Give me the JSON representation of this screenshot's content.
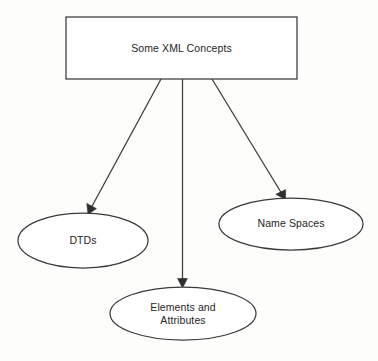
{
  "diagram": {
    "title_node": {
      "label": "Some XML Concepts",
      "shape": "rectangle"
    },
    "children": [
      {
        "id": "dtds",
        "label": "DTDs",
        "shape": "ellipse"
      },
      {
        "id": "elements-and-attributes",
        "label_line1": "Elements and",
        "label_line2": "Attributes",
        "shape": "ellipse"
      },
      {
        "id": "name-spaces",
        "label": "Name Spaces",
        "shape": "ellipse"
      }
    ],
    "colors": {
      "stroke": "#3a3a3a",
      "text": "#262626",
      "fill": "#ffffff",
      "background": "#fdfdfc"
    }
  }
}
